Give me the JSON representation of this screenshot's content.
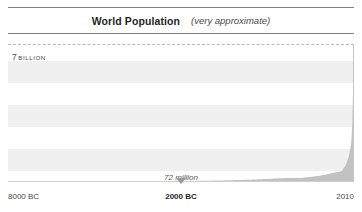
{
  "chart_data": {
    "type": "area",
    "title": "World Population",
    "subtitle": "(very approximate)",
    "xlabel": "",
    "ylabel": "",
    "grid": true,
    "legend_position": "none",
    "xlim": [
      "8000 BC",
      "2010"
    ],
    "ylim": [
      0,
      7000000000
    ],
    "y_tick_labels": [
      "7 BILLION"
    ],
    "y_tick_value": "7",
    "y_tick_unit": "BILLION",
    "x_tick_labels": [
      "8000 BC",
      "2000 BC",
      "2010"
    ],
    "x": [
      -8000,
      -7000,
      -6000,
      -5000,
      -4000,
      -3000,
      -2000,
      -1000,
      0,
      500,
      1000,
      1250,
      1500,
      1650,
      1750,
      1800,
      1850,
      1900,
      1927,
      1950,
      1960,
      1974,
      1987,
      1999,
      2010
    ],
    "x_labels": [
      "8000 BC",
      "7000 BC",
      "6000 BC",
      "5000 BC",
      "4000 BC",
      "3000 BC",
      "2000 BC",
      "1000 BC",
      "1 AD",
      "500",
      "1000",
      "1250",
      "1500",
      "1650",
      "1750",
      "1800",
      "1850",
      "1900",
      "1927",
      "1950",
      "1960",
      "1974",
      "1987",
      "1999",
      "2010"
    ],
    "values": [
      5000000,
      7000000,
      10000000,
      15000000,
      25000000,
      45000000,
      72000000,
      115000000,
      200000000,
      210000000,
      310000000,
      400000000,
      500000000,
      550000000,
      790000000,
      980000000,
      1260000000,
      1650000000,
      2000000000,
      2500000000,
      3000000000,
      4000000000,
      5000000000,
      6000000000,
      7000000000
    ],
    "annotations": [
      {
        "label": "72 million",
        "x_label": "2000 BC",
        "value": 72000000,
        "marker": "down-triangle"
      }
    ],
    "colors": {
      "band": "#f0f0f0",
      "curve": "#bdbdbd",
      "gridline": "#b9b9b9",
      "rule": "#7d7f82",
      "marker": "#9a9a9a",
      "text": "#4a4a4a",
      "background": "#ffffff"
    }
  }
}
